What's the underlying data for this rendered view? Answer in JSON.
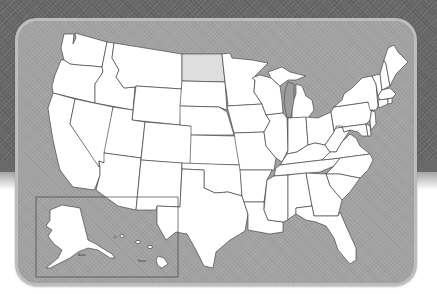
{
  "map": {
    "title": "United States",
    "highlighted_state": "North Dakota",
    "colors": {
      "background_top": "#6a6a6a",
      "background_bottom": "#ffffff",
      "panel": "#a3a3a3",
      "panel_border": "#bdbdbd",
      "state_fill": "#ffffff",
      "state_stroke": "#333333",
      "highlight_fill": "#dedede"
    },
    "inset": {
      "alaska_label": "Alaska",
      "hawaii_label": "Hawaii"
    }
  }
}
